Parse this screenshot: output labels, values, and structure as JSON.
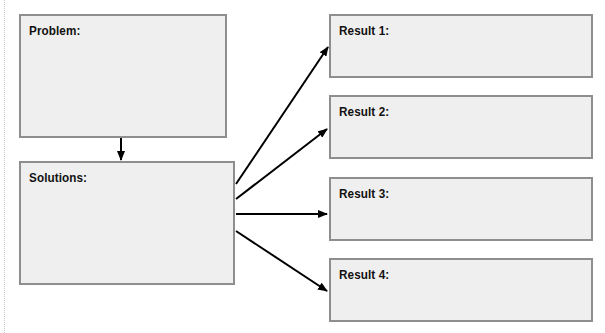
{
  "diagram": {
    "type": "flowchart",
    "colors": {
      "box_fill": "#efefef",
      "box_border": "#8e8e8e",
      "arrow": "#000000",
      "text": "#111111"
    },
    "boxes": {
      "problem": {
        "label": "Problem:"
      },
      "solutions": {
        "label": "Solutions:"
      },
      "results": [
        {
          "label": "Result 1:"
        },
        {
          "label": "Result 2:"
        },
        {
          "label": "Result 3:"
        },
        {
          "label": "Result 4:"
        }
      ]
    },
    "edges": [
      {
        "from": "Problem:",
        "to": "Solutions:"
      },
      {
        "from": "Solutions:",
        "to": "Result 1:"
      },
      {
        "from": "Solutions:",
        "to": "Result 2:"
      },
      {
        "from": "Solutions:",
        "to": "Result 3:"
      },
      {
        "from": "Solutions:",
        "to": "Result 4:"
      }
    ]
  }
}
